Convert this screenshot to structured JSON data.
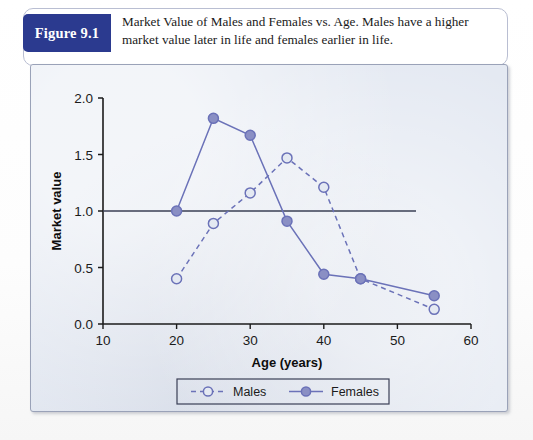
{
  "figure": {
    "badge_label": "Figure 9.1",
    "caption": "Market Value of Males and Females vs. Age. Males have a higher market value later in life and females earlier in life."
  },
  "colors": {
    "badge_navy": "#2b3a8f",
    "series_blue": "#6b72b8",
    "marker_fill": "#8a8fc4",
    "panel_background": "#e4e9f2",
    "axis_black": "#1b1b1b"
  },
  "chart_data": {
    "type": "line",
    "title": "",
    "xlabel": "Age (years)",
    "ylabel": "Market value",
    "xlim": [
      10,
      60
    ],
    "ylim": [
      0.0,
      2.0
    ],
    "xticks": [
      10,
      20,
      30,
      40,
      50,
      60
    ],
    "yticks": [
      0.0,
      0.5,
      1.0,
      1.5,
      2.0
    ],
    "ytick_labels": [
      "0.0",
      "0.5",
      "1.0",
      "1.5",
      "2.0"
    ],
    "xtick_labels": [
      "10",
      "20",
      "30",
      "40",
      "50",
      "60"
    ],
    "grid": false,
    "reference_line": {
      "axis": "y",
      "value": 1.0
    },
    "legend_position": "below",
    "series": [
      {
        "name": "Males",
        "style": "dashed",
        "marker": "open-circle",
        "x": [
          20,
          25,
          30,
          35,
          40,
          45,
          55
        ],
        "values": [
          0.4,
          0.89,
          1.16,
          1.47,
          1.21,
          0.4,
          0.13
        ]
      },
      {
        "name": "Females",
        "style": "solid",
        "marker": "filled-circle",
        "x": [
          20,
          25,
          30,
          35,
          40,
          45,
          55
        ],
        "values": [
          1.0,
          1.82,
          1.67,
          0.91,
          0.44,
          0.4,
          0.25
        ]
      }
    ]
  },
  "legend": {
    "items": [
      {
        "label": "Males"
      },
      {
        "label": "Females"
      }
    ]
  }
}
